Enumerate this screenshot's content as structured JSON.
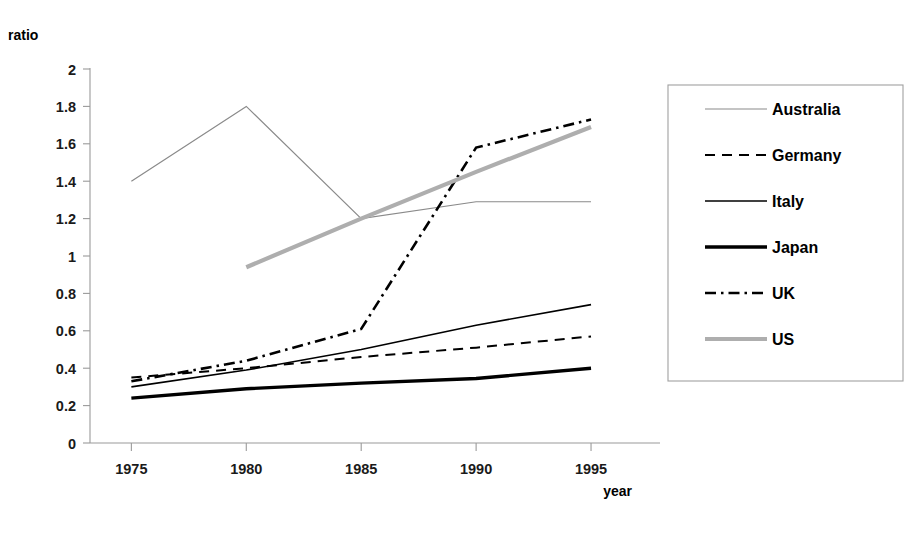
{
  "chart_data": {
    "type": "line",
    "title": "",
    "xlabel": "year",
    "ylabel": "ratio",
    "x": [
      1975,
      1980,
      1985,
      1990,
      1995
    ],
    "xtick_labels": [
      "1975",
      "1980",
      "1985",
      "1990",
      "1995"
    ],
    "xlim": [
      1973.2,
      1997.0
    ],
    "ylim": [
      0,
      2
    ],
    "ytick_labels": [
      "0",
      "0.2",
      "0.4",
      "0.6",
      "0.8",
      "1",
      "1.2",
      "1.4",
      "1.6",
      "1.8",
      "2"
    ],
    "ytick_values": [
      0,
      0.2,
      0.4,
      0.6,
      0.8,
      1,
      1.2,
      1.4,
      1.6,
      1.8,
      2
    ],
    "grid": false,
    "legend_position": "right",
    "series": [
      {
        "name": "Australia",
        "x": [
          1975,
          1980,
          1985,
          1990,
          1995
        ],
        "values": [
          1.4,
          1.8,
          1.2,
          1.29,
          1.29
        ],
        "color": "#8a8a8a",
        "width": 1.2,
        "dash": "none"
      },
      {
        "name": "Germany",
        "x": [
          1975,
          1980,
          1985,
          1990,
          1995
        ],
        "values": [
          0.35,
          0.4,
          0.46,
          0.51,
          0.57
        ],
        "color": "#000000",
        "width": 2.0,
        "dash": "dashed"
      },
      {
        "name": "Italy",
        "x": [
          1975,
          1980,
          1985,
          1990,
          1995
        ],
        "values": [
          0.3,
          0.39,
          0.5,
          0.63,
          0.74
        ],
        "color": "#000000",
        "width": 1.6,
        "dash": "none"
      },
      {
        "name": "Japan",
        "x": [
          1975,
          1980,
          1985,
          1990,
          1995
        ],
        "values": [
          0.24,
          0.29,
          0.32,
          0.345,
          0.4
        ],
        "color": "#000000",
        "width": 3.4,
        "dash": "none"
      },
      {
        "name": "UK",
        "x": [
          1975,
          1980,
          1985,
          1990,
          1995
        ],
        "values": [
          0.33,
          0.44,
          0.61,
          1.58,
          1.73
        ],
        "color": "#000000",
        "width": 2.6,
        "dash": "dashdot"
      },
      {
        "name": "US",
        "x": [
          1980,
          1985,
          1990,
          1995
        ],
        "values": [
          0.94,
          1.2,
          1.45,
          1.69
        ],
        "color": "#aeaeae",
        "width": 4.2,
        "dash": "none"
      }
    ]
  },
  "legend": {
    "entries": [
      {
        "label": "Australia"
      },
      {
        "label": "Germany"
      },
      {
        "label": "Italy"
      },
      {
        "label": "Japan"
      },
      {
        "label": "UK"
      },
      {
        "label": "US"
      }
    ]
  },
  "labels": {
    "ylabel": "ratio",
    "xlabel": "year"
  }
}
